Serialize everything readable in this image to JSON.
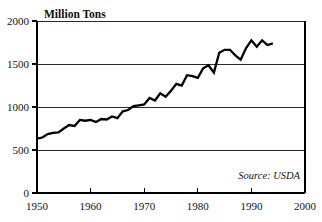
{
  "chart_data": {
    "type": "line",
    "title": "Million Tons",
    "xlabel": "",
    "ylabel": "Million Tons",
    "xlim": [
      1950,
      2000
    ],
    "ylim": [
      0,
      2000
    ],
    "grid": true,
    "legend": null,
    "source_note": "Source: USDA",
    "y_ticks": [
      0,
      500,
      1000,
      1500,
      2000
    ],
    "y_tick_labels": [
      "0",
      "500",
      "1000",
      "1500",
      "2000"
    ],
    "x_ticks": [
      1950,
      1960,
      1970,
      1980,
      1990,
      2000
    ],
    "x_tick_labels": [
      "1950",
      "1960",
      "1970",
      "1980",
      "1990",
      "2000"
    ],
    "series": [
      {
        "name": "World Grain Production",
        "x": [
          1950,
          1951,
          1952,
          1953,
          1954,
          1955,
          1956,
          1957,
          1958,
          1959,
          1960,
          1961,
          1962,
          1963,
          1964,
          1965,
          1966,
          1967,
          1968,
          1969,
          1970,
          1971,
          1972,
          1973,
          1974,
          1975,
          1976,
          1977,
          1978,
          1979,
          1980,
          1981,
          1982,
          1983,
          1984,
          1985,
          1986,
          1987,
          1988,
          1989,
          1990,
          1991,
          1992,
          1993,
          1994
        ],
        "values": [
          631,
          645,
          685,
          700,
          705,
          750,
          790,
          780,
          850,
          840,
          850,
          825,
          860,
          855,
          890,
          870,
          950,
          965,
          1010,
          1020,
          1030,
          1105,
          1075,
          1160,
          1120,
          1190,
          1270,
          1250,
          1370,
          1360,
          1340,
          1450,
          1485,
          1400,
          1630,
          1665,
          1665,
          1600,
          1550,
          1685,
          1775,
          1700,
          1775,
          1720,
          1740
        ]
      }
    ]
  },
  "figure": {
    "title_text": "Million Tons",
    "source_text": "Source: USDA"
  }
}
